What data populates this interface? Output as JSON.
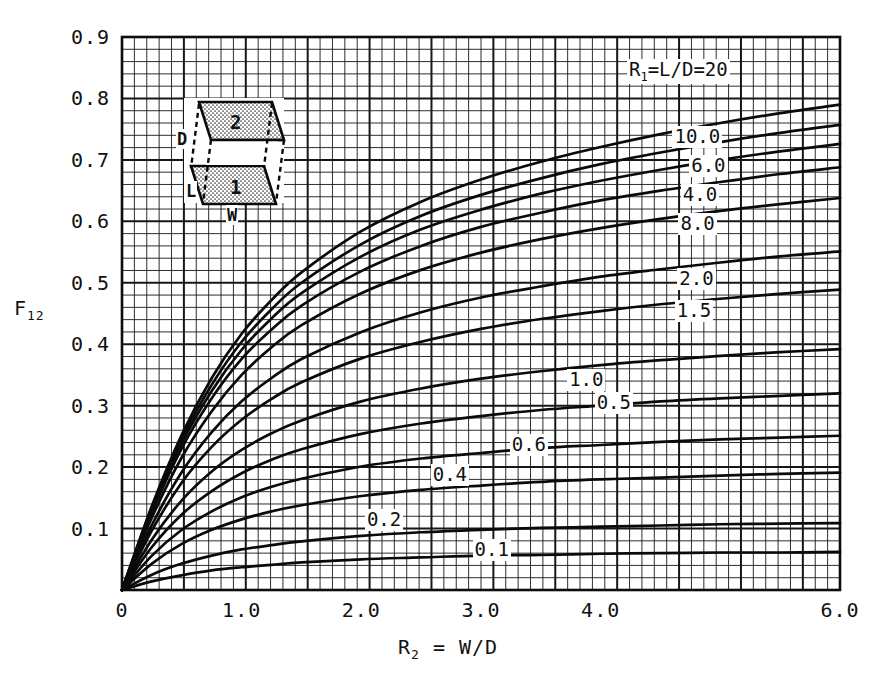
{
  "figure": {
    "kind": "engineering-view-factor-chart",
    "background": "#ffffff",
    "ink": "#111111"
  },
  "chart_data": {
    "type": "line",
    "title": "",
    "xlabel": "R2 = W/D",
    "ylabel": "F12",
    "xlim": [
      0,
      6.0
    ],
    "ylim": [
      0,
      0.9
    ],
    "grid": true,
    "grid_minor_step_x": 0.1,
    "grid_minor_step_y": 0.0125,
    "grid_major_every": 5,
    "legend_position": "inline-labels",
    "x_ticks": [
      {
        "value": 0,
        "label": "0"
      },
      {
        "value": 1.0,
        "label": "1.0"
      },
      {
        "value": 2.0,
        "label": "2.0"
      },
      {
        "value": 3.0,
        "label": "3.0"
      },
      {
        "value": 4.0,
        "label": "4.0"
      },
      {
        "value": 6.0,
        "label": "6.0"
      }
    ],
    "y_ticks": [
      {
        "value": 0.1,
        "label": "0.1"
      },
      {
        "value": 0.2,
        "label": "0.2"
      },
      {
        "value": 0.3,
        "label": "0.3"
      },
      {
        "value": 0.4,
        "label": "0.4"
      },
      {
        "value": 0.5,
        "label": "0.5"
      },
      {
        "value": 0.6,
        "label": "0.6"
      },
      {
        "value": 0.7,
        "label": "0.7"
      },
      {
        "value": 0.8,
        "label": "0.8"
      },
      {
        "value": 0.9,
        "label": "0.9"
      }
    ],
    "series": [
      {
        "name": "R1=L/D=20",
        "label": "R₁=L/D=20",
        "label_x": 4.22,
        "label_y": 0.845,
        "x": [
          0,
          0.25,
          0.5,
          0.75,
          1.0,
          1.25,
          1.5,
          2.0,
          2.5,
          3.0,
          3.5,
          4.0,
          4.5,
          5.0,
          5.5,
          6.0
        ],
        "y": [
          0,
          0.137,
          0.253,
          0.345,
          0.417,
          0.472,
          0.517,
          0.584,
          0.632,
          0.668,
          0.697,
          0.721,
          0.742,
          0.76,
          0.776,
          0.79
        ]
      },
      {
        "name": "10.0",
        "label": "10.0",
        "label_x": 4.6,
        "label_y": 0.735,
        "x": [
          0,
          0.25,
          0.5,
          0.75,
          1.0,
          1.25,
          1.5,
          2.0,
          2.5,
          3.0,
          3.5,
          4.0,
          4.5,
          5.0,
          5.5,
          6.0
        ],
        "y": [
          0,
          0.134,
          0.246,
          0.334,
          0.404,
          0.457,
          0.5,
          0.563,
          0.609,
          0.643,
          0.67,
          0.693,
          0.712,
          0.729,
          0.744,
          0.757
        ]
      },
      {
        "name": "6.0",
        "label": "6.0",
        "label_x": 4.74,
        "label_y": 0.688,
        "x": [
          0,
          0.25,
          0.5,
          0.75,
          1.0,
          1.25,
          1.5,
          2.0,
          2.5,
          3.0,
          3.5,
          4.0,
          4.5,
          5.0,
          5.5,
          6.0
        ],
        "y": [
          0,
          0.13,
          0.239,
          0.324,
          0.391,
          0.442,
          0.483,
          0.543,
          0.587,
          0.619,
          0.645,
          0.666,
          0.684,
          0.7,
          0.714,
          0.726
        ]
      },
      {
        "name": "4.0",
        "label": "4.0",
        "label_x": 4.67,
        "label_y": 0.641,
        "x": [
          0,
          0.25,
          0.5,
          0.75,
          1.0,
          1.25,
          1.5,
          2.0,
          2.5,
          3.0,
          3.5,
          4.0,
          4.5,
          5.0,
          5.5,
          6.0
        ],
        "y": [
          0,
          0.126,
          0.231,
          0.312,
          0.376,
          0.424,
          0.463,
          0.519,
          0.56,
          0.591,
          0.614,
          0.634,
          0.65,
          0.664,
          0.677,
          0.688
        ]
      },
      {
        "name": "8.0",
        "label": "8.0",
        "label_x": 4.65,
        "label_y": 0.594,
        "x": [
          0,
          0.25,
          0.5,
          0.75,
          1.0,
          1.25,
          1.5,
          2.0,
          2.5,
          3.0,
          3.5,
          4.0,
          4.5,
          5.0,
          5.5,
          6.0
        ],
        "y": [
          0,
          0.118,
          0.216,
          0.291,
          0.35,
          0.395,
          0.431,
          0.483,
          0.521,
          0.549,
          0.571,
          0.589,
          0.604,
          0.617,
          0.628,
          0.638
        ]
      },
      {
        "name": "2.0",
        "label": "2.0",
        "label_x": 4.64,
        "label_y": 0.505,
        "x": [
          0,
          0.25,
          0.5,
          0.75,
          1.0,
          1.25,
          1.5,
          2.0,
          2.5,
          3.0,
          3.5,
          4.0,
          4.5,
          5.0,
          5.5,
          6.0
        ],
        "y": [
          0,
          0.106,
          0.192,
          0.257,
          0.307,
          0.345,
          0.376,
          0.42,
          0.452,
          0.476,
          0.494,
          0.51,
          0.522,
          0.533,
          0.543,
          0.551
        ]
      },
      {
        "name": "1.5",
        "label": "1.5",
        "label_x": 4.62,
        "label_y": 0.452,
        "x": [
          0,
          0.25,
          0.5,
          0.75,
          1.0,
          1.25,
          1.5,
          2.0,
          2.5,
          3.0,
          3.5,
          4.0,
          4.5,
          5.0,
          5.5,
          6.0
        ],
        "y": [
          0,
          0.097,
          0.175,
          0.233,
          0.277,
          0.311,
          0.338,
          0.377,
          0.404,
          0.425,
          0.441,
          0.454,
          0.465,
          0.474,
          0.482,
          0.489
        ]
      },
      {
        "name": "1.0",
        "label": "1.0",
        "label_x": 3.72,
        "label_y": 0.34,
        "x": [
          0,
          0.25,
          0.5,
          0.75,
          1.0,
          1.25,
          1.5,
          2.0,
          2.5,
          3.0,
          3.5,
          4.0,
          4.5,
          5.0,
          5.5,
          6.0
        ],
        "y": [
          0,
          0.082,
          0.146,
          0.193,
          0.228,
          0.255,
          0.276,
          0.307,
          0.328,
          0.344,
          0.356,
          0.366,
          0.374,
          0.381,
          0.387,
          0.392
        ]
      },
      {
        "name": "0.5",
        "label": "0.5",
        "label_x": 3.95,
        "label_y": 0.303,
        "x": [
          0,
          0.25,
          0.5,
          0.75,
          1.0,
          1.25,
          1.5,
          2.0,
          2.5,
          3.0,
          3.5,
          4.0,
          4.5,
          5.0,
          5.5,
          6.0
        ],
        "y": [
          0,
          0.07,
          0.123,
          0.161,
          0.19,
          0.212,
          0.229,
          0.254,
          0.271,
          0.283,
          0.293,
          0.3,
          0.307,
          0.312,
          0.316,
          0.32
        ]
      },
      {
        "name": "0.6",
        "label": "0.6",
        "label_x": 3.24,
        "label_y": 0.235,
        "x": [
          0,
          0.25,
          0.5,
          0.75,
          1.0,
          1.25,
          1.5,
          2.0,
          2.5,
          3.0,
          3.5,
          4.0,
          4.5,
          5.0,
          5.5,
          6.0
        ],
        "y": [
          0,
          0.056,
          0.098,
          0.128,
          0.151,
          0.168,
          0.181,
          0.201,
          0.214,
          0.223,
          0.231,
          0.236,
          0.241,
          0.245,
          0.248,
          0.251
        ]
      },
      {
        "name": "0.4",
        "label": "0.4",
        "label_x": 2.58,
        "label_y": 0.185,
        "x": [
          0,
          0.25,
          0.5,
          0.75,
          1.0,
          1.25,
          1.5,
          2.0,
          2.5,
          3.0,
          3.5,
          4.0,
          4.5,
          5.0,
          5.5,
          6.0
        ],
        "y": [
          0,
          0.043,
          0.075,
          0.098,
          0.115,
          0.128,
          0.138,
          0.153,
          0.163,
          0.17,
          0.176,
          0.18,
          0.183,
          0.186,
          0.189,
          0.191
        ]
      },
      {
        "name": "0.2",
        "label": "0.2",
        "label_x": 2.03,
        "label_y": 0.113,
        "x": [
          0,
          0.25,
          0.5,
          0.75,
          1.0,
          1.25,
          1.5,
          2.0,
          2.5,
          3.0,
          3.5,
          4.0,
          4.5,
          5.0,
          5.5,
          6.0
        ],
        "y": [
          0,
          0.025,
          0.043,
          0.056,
          0.066,
          0.073,
          0.079,
          0.088,
          0.094,
          0.098,
          0.101,
          0.103,
          0.105,
          0.107,
          0.108,
          0.109
        ]
      },
      {
        "name": "0.1",
        "label": "0.1",
        "label_x": 2.93,
        "label_y": 0.063,
        "x": [
          0,
          0.25,
          0.5,
          0.75,
          1.0,
          1.25,
          1.5,
          2.0,
          2.5,
          3.0,
          3.5,
          4.0,
          4.5,
          5.0,
          5.5,
          6.0
        ],
        "y": [
          0,
          0.014,
          0.024,
          0.032,
          0.037,
          0.041,
          0.045,
          0.05,
          0.053,
          0.056,
          0.057,
          0.059,
          0.06,
          0.061,
          0.061,
          0.062
        ]
      }
    ]
  },
  "inset": {
    "surface_top_label": "2",
    "surface_bottom_label": "1",
    "dim_depth_label": "D",
    "dim_length_label": "L",
    "dim_width_label": "W"
  }
}
